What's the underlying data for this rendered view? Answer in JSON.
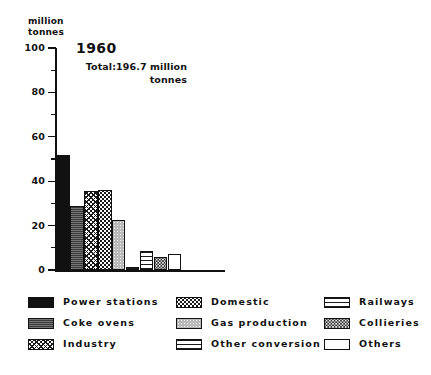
{
  "axis_unit_label": "million\ntonnes",
  "caption": "",
  "chart_data": [
    {
      "type": "bar",
      "title": "1960",
      "subtitle": "Total:196.7 million\ntonnes",
      "ylabel": "million tonnes",
      "xlabel": "",
      "ylim": [
        0,
        100
      ],
      "yticks": [
        0,
        20,
        40,
        60,
        80,
        100
      ],
      "ytick_labels": [
        "0",
        "20",
        "40",
        "60",
        "80",
        "100"
      ],
      "yminor_step": 10,
      "grid": false,
      "legend_position": "below",
      "categories": [
        "Power stations",
        "Coke ovens",
        "Industry",
        "Domestic",
        "Gas production",
        "Other conversion",
        "Railways",
        "Collieries",
        "Others"
      ],
      "values": [
        52.0,
        29.0,
        35.5,
        36.0,
        22.5,
        1.5,
        8.5,
        6.0,
        7.0
      ]
    },
    {
      "type": "bar",
      "title": "1979",
      "subtitle": "Total: 129.4 million\ntonnes",
      "ylabel": "million tonnes",
      "xlabel": "",
      "ylim": [
        0,
        100
      ],
      "yticks": [
        0,
        20,
        40,
        60,
        80,
        100
      ],
      "ytick_labels": [
        "0",
        "20",
        "40",
        "60",
        "80",
        "100"
      ],
      "yminor_step": 10,
      "grid": false,
      "legend_position": "below",
      "categories": [
        "Power stations",
        "Coke ovens",
        "Industry",
        "Domestic",
        "Gas production",
        "Other conversion",
        "Railways",
        "Collieries",
        "Others"
      ],
      "values": [
        89.0,
        15.0,
        10.0,
        11.0,
        0.0,
        0.0,
        3.0,
        0.6,
        2.5
      ]
    }
  ],
  "legend": {
    "items": [
      {
        "label": "Power stations",
        "pattern": "solid",
        "col": 0,
        "row": 0
      },
      {
        "label": "Coke ovens",
        "pattern": "dark",
        "col": 0,
        "row": 1
      },
      {
        "label": "Industry",
        "pattern": "crosshatch",
        "col": 0,
        "row": 2
      },
      {
        "label": "Domestic",
        "pattern": "dots",
        "col": 1,
        "row": 0
      },
      {
        "label": "Gas production",
        "pattern": "grey",
        "col": 1,
        "row": 1
      },
      {
        "label": "Other conversion",
        "pattern": "dashrow",
        "col": 1,
        "row": 2
      },
      {
        "label": "Railways",
        "pattern": "hlines",
        "col": 2,
        "row": 0
      },
      {
        "label": "Collieries",
        "pattern": "speckle",
        "col": 2,
        "row": 1
      },
      {
        "label": "Others",
        "pattern": "white",
        "col": 2,
        "row": 2
      }
    ]
  },
  "colors": {
    "ink": "#111111",
    "background": "#ffffff",
    "grey_fill": "#b9b9b9",
    "dark_fill": "#3a3a3a"
  }
}
